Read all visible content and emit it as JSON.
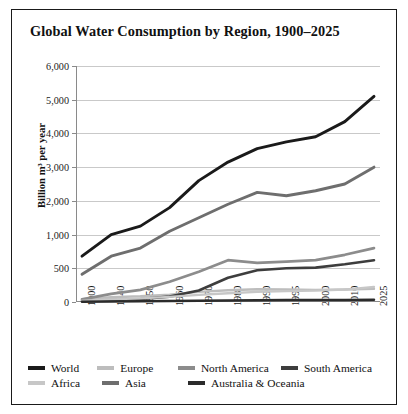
{
  "chart_data": {
    "type": "line",
    "title": "Global Water Consumption by Region, 1900–2025",
    "xlabel": "",
    "ylabel": "Billion m³ per year",
    "grid": true,
    "legend_position": "bottom",
    "axis_note": "y-axis ticks are unevenly valued but evenly spaced",
    "categories": [
      "1900",
      "1940",
      "1950",
      "1960",
      "1970",
      "1980",
      "1990",
      "1995",
      "2000",
      "2010",
      "2025"
    ],
    "ytick_values": [
      0,
      500,
      1000,
      2000,
      3000,
      4000,
      5000,
      6000
    ],
    "ytick_labels": [
      "0",
      "500",
      "1,000",
      "2,000",
      "3,000",
      "4,000",
      "5,000",
      "6,000"
    ],
    "ylim": [
      0,
      6000
    ],
    "series": [
      {
        "name": "World",
        "color": "#1a1a1a",
        "width": 2.9,
        "values": [
          680,
          1000,
          1250,
          1800,
          2600,
          3150,
          3550,
          3750,
          3900,
          4350,
          5100
        ]
      },
      {
        "name": "Europe",
        "color": "#bdbdbd",
        "width": 2.4,
        "values": [
          40,
          70,
          85,
          110,
          150,
          175,
          190,
          185,
          180,
          185,
          195
        ]
      },
      {
        "name": "North America",
        "color": "#8c8c8c",
        "width": 2.7,
        "values": [
          40,
          120,
          180,
          300,
          450,
          620,
          580,
          600,
          620,
          700,
          800
        ]
      },
      {
        "name": "South America",
        "color": "#3d3d3d",
        "width": 2.6,
        "values": [
          15,
          30,
          45,
          80,
          170,
          360,
          470,
          500,
          510,
          560,
          620
        ]
      },
      {
        "name": "Africa",
        "color": "#c7c7c7",
        "width": 2.3,
        "values": [
          20,
          40,
          55,
          75,
          105,
          130,
          150,
          160,
          170,
          185,
          225
        ]
      },
      {
        "name": "Asia",
        "color": "#6e6e6e",
        "width": 2.9,
        "values": [
          410,
          680,
          800,
          1100,
          1500,
          1900,
          2250,
          2150,
          2300,
          2500,
          3000
        ]
      },
      {
        "name": "Australia & Oceania",
        "color": "#2b2b2b",
        "width": 2.5,
        "values": [
          5,
          9,
          12,
          16,
          20,
          24,
          27,
          28,
          29,
          31,
          34
        ]
      }
    ]
  },
  "legend_rows": [
    [
      "World",
      "Europe",
      "North America",
      "South America"
    ],
    [
      "Africa",
      "Asia",
      "Australia & Oceania"
    ]
  ]
}
